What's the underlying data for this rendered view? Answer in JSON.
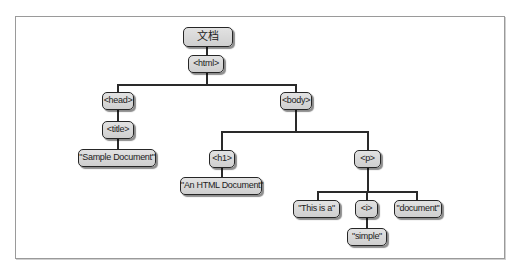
{
  "diagram": {
    "type": "dom-tree",
    "root": {
      "label": "文档"
    },
    "nodes": {
      "html": "<html>",
      "head": "<head>",
      "title": "<title>",
      "title_text": "\"Sample Document\"",
      "body": "<body>",
      "h1": "<h1>",
      "h1_text": "\"An HTML Document\"",
      "p": "<p>",
      "p_text1": "\"This is a\"",
      "i": "<i>",
      "i_text": "\"simple\"",
      "p_text2": "\"document\""
    },
    "edges": [
      [
        "root",
        "html"
      ],
      [
        "html",
        "head"
      ],
      [
        "html",
        "body"
      ],
      [
        "head",
        "title"
      ],
      [
        "title",
        "title_text"
      ],
      [
        "body",
        "h1"
      ],
      [
        "body",
        "p"
      ],
      [
        "h1",
        "h1_text"
      ],
      [
        "p",
        "p_text1"
      ],
      [
        "p",
        "i"
      ],
      [
        "p",
        "p_text2"
      ],
      [
        "i",
        "i_text"
      ]
    ]
  }
}
